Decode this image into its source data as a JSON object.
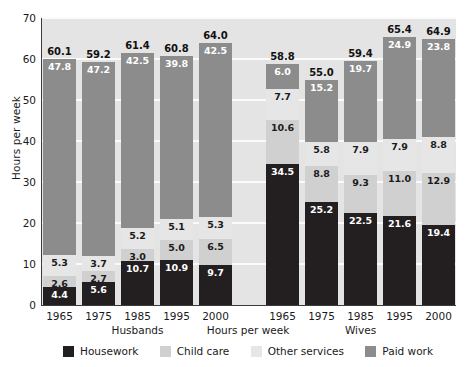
{
  "chart_data": {
    "type": "bar",
    "subtype": "stacked-bar-grouped",
    "title": "",
    "xlabel": "Hours per week",
    "ylabel": "Hours per week",
    "ylim": [
      0,
      70
    ],
    "yticks": [
      0,
      10,
      20,
      30,
      40,
      50,
      60,
      70
    ],
    "grid": true,
    "legend_position": "bottom",
    "group_labels": [
      "Husbands",
      "Wives"
    ],
    "categories": [
      "1965",
      "1975",
      "1985",
      "1995",
      "2000"
    ],
    "series": [
      {
        "name": "Housework",
        "color": "#231f20",
        "husbands": [
          4.4,
          5.6,
          10.7,
          10.9,
          9.7
        ],
        "wives": [
          34.5,
          25.2,
          22.5,
          21.6,
          19.4
        ]
      },
      {
        "name": "Child care",
        "color": "#d0d0d0",
        "husbands": [
          2.6,
          2.7,
          3.0,
          5.0,
          6.5
        ],
        "wives": [
          10.6,
          8.8,
          9.3,
          11.0,
          12.9
        ]
      },
      {
        "name": "Other services",
        "color": "#e6e6e6",
        "husbands": [
          5.3,
          3.7,
          5.2,
          5.1,
          5.3
        ],
        "wives": [
          7.7,
          5.8,
          7.9,
          7.9,
          8.8
        ]
      },
      {
        "name": "Paid work",
        "color": "#8c8c8c",
        "husbands": [
          47.8,
          47.2,
          42.5,
          39.8,
          42.5
        ],
        "wives": [
          6.0,
          15.2,
          19.7,
          24.9,
          23.8
        ]
      }
    ],
    "totals": {
      "husbands": [
        60.1,
        59.2,
        61.4,
        60.8,
        64.0
      ],
      "wives": [
        58.8,
        55.0,
        59.4,
        65.4,
        64.9
      ]
    }
  },
  "legend": {
    "items": [
      {
        "label": "Housework",
        "color": "#231f20"
      },
      {
        "label": "Child care",
        "color": "#d0d0d0"
      },
      {
        "label": "Other services",
        "color": "#e6e6e6"
      },
      {
        "label": "Paid work",
        "color": "#8c8c8c"
      }
    ]
  },
  "axes": {
    "y_title": "Hours per week",
    "x_title": "Hours per week",
    "y_ticks": [
      "0",
      "10",
      "20",
      "30",
      "40",
      "50",
      "60",
      "70"
    ]
  }
}
